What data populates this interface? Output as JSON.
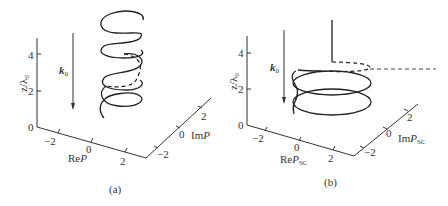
{
  "panels": [
    {
      "id": "a",
      "caption": "(a)",
      "z_axis_label": "z/λ₀",
      "z_ticks": [
        "0",
        "2",
        "4"
      ],
      "re_axis_label": "ReP",
      "re_label_main": "Re",
      "re_label_var": "P",
      "re_ticks": [
        "−2",
        "0",
        "2"
      ],
      "im_axis_label": "ImP",
      "im_label_main": "Im",
      "im_label_var": "P",
      "im_ticks": [
        "−2",
        "0",
        "2"
      ],
      "wavevector_label": "k",
      "wavevector_sub": "0",
      "curve": "helix (multiple turns, with dashed segment)"
    },
    {
      "id": "b",
      "caption": "(b)",
      "z_axis_label": "z/λ₀",
      "z_ticks": [
        "0",
        "2",
        "4"
      ],
      "re_axis_label": "ReP_SC",
      "re_label_main": "Re",
      "re_label_var": "P",
      "re_label_sub": "SC",
      "re_ticks": [
        "−2",
        "0",
        "2"
      ],
      "im_axis_label": "ImP_SC",
      "im_label_main": "Im",
      "im_label_var": "P",
      "im_label_sub": "SC",
      "im_ticks": [
        "−2",
        "0",
        "2"
      ],
      "wavevector_label": "k",
      "wavevector_sub": "0",
      "curve": "two stacked ellipses with vertical line and dashed extension"
    }
  ]
}
